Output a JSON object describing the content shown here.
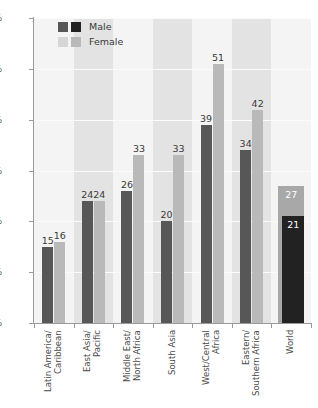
{
  "chart_data": {
    "type": "bar",
    "title": "",
    "subtitle": "",
    "xlabel": "",
    "ylabel": "",
    "ylim": [
      0,
      60
    ],
    "ytick_labels": [
      "0%",
      "10%",
      "20%",
      "30%",
      "40%",
      "50%",
      "60%"
    ],
    "ytick_values": [
      0,
      10,
      20,
      30,
      40,
      50,
      60
    ],
    "grid": true,
    "legend_position": "top-left",
    "value_suffix": "",
    "categories": [
      "Latin America/\nCaribbean",
      "East Asia/\nPacific",
      "Middle East/\nNorth Africa",
      "South Asia",
      "West/Central\nAfrica",
      "Eastern/\nSouthern Africa",
      "World"
    ],
    "category_lines": [
      [
        "Latin America/",
        "Caribbean"
      ],
      [
        "East Asia/",
        "Pacific"
      ],
      [
        "Middle East/",
        "North Africa"
      ],
      [
        "South Asia"
      ],
      [
        "West/Central",
        "Africa"
      ],
      [
        "Eastern/",
        "Southern Africa"
      ],
      [
        "World"
      ]
    ],
    "series": [
      {
        "name": "Male",
        "values": [
          15,
          24,
          26,
          20,
          39,
          34,
          21
        ]
      },
      {
        "name": "Female",
        "values": [
          16,
          24,
          33,
          33,
          51,
          42,
          27
        ]
      }
    ],
    "data_labels": {
      "Male": [
        "15",
        "24",
        "26",
        "20",
        "39",
        "34",
        "21"
      ],
      "Female": [
        "16",
        "24",
        "33",
        "33",
        "51",
        "42",
        "27"
      ]
    }
  },
  "legend": {
    "entries": [
      {
        "label": "Male",
        "swatch_primary": "#575757",
        "swatch_secondary": "#222222"
      },
      {
        "label": "Female",
        "swatch_primary": "#d6d6d6",
        "swatch_secondary": "#b9b9b9"
      }
    ]
  },
  "colors": {
    "male_bar": "#575757",
    "female_bar": "#b9b9b9",
    "world_male_bar": "#222222",
    "world_female_bar": "#a8a8a8",
    "plot_background": "#f2f2f2",
    "band_dark": "#e3e3e3",
    "band_light": "#f4f4f4",
    "axis": "#9a9a9a",
    "gridline": "#fbfbfb",
    "text": "#3a3a3a",
    "tick_text": "#59595b",
    "inside_label_text": "#ffffff"
  }
}
